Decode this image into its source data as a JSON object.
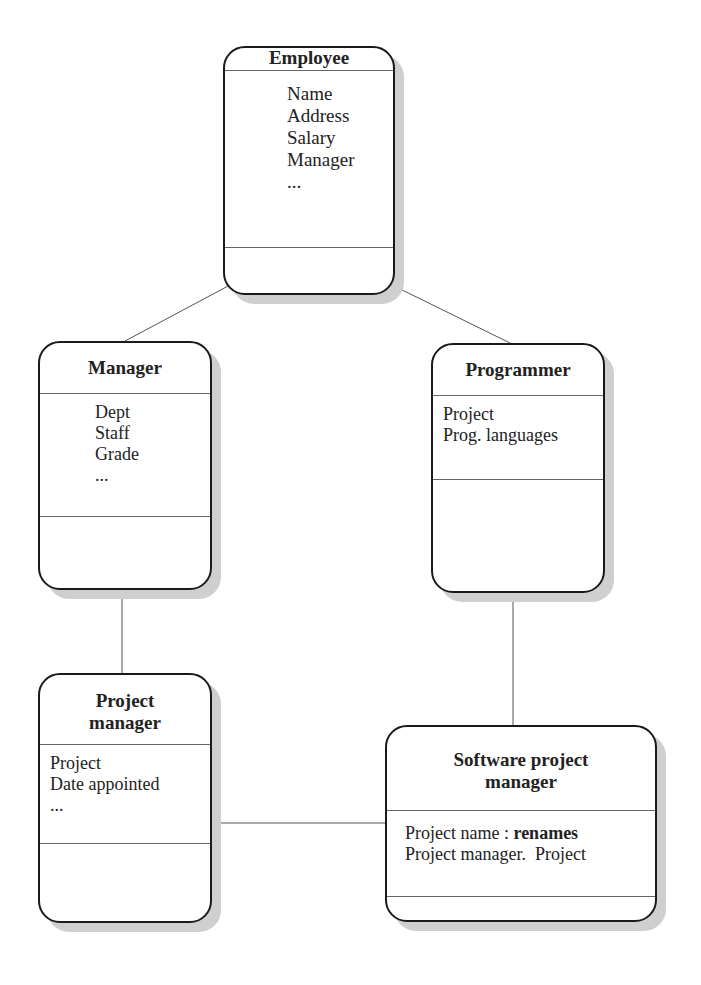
{
  "diagram": {
    "type": "class-hierarchy",
    "classes": {
      "employee": {
        "name": "Employee",
        "attributes": [
          "Name",
          "Address",
          "Salary",
          "Manager",
          "..."
        ]
      },
      "manager": {
        "name": "Manager",
        "attributes": [
          "Dept",
          "Staff",
          "Grade",
          "..."
        ]
      },
      "programmer": {
        "name": "Programmer",
        "attributes": [
          "Project",
          "Prog. languages"
        ]
      },
      "project_manager": {
        "name_line1": "Project",
        "name_line2": "manager",
        "attributes": [
          "Project",
          "Date appointed",
          "..."
        ]
      },
      "software_project_manager": {
        "name_line1": "Software project",
        "name_line2": "manager",
        "attributes": [
          {
            "text": "Project name : ",
            "bold": "renames"
          },
          {
            "text": "Project manager.  Project"
          }
        ]
      }
    },
    "links": [
      {
        "from": "Employee",
        "to": "Manager"
      },
      {
        "from": "Employee",
        "to": "Programmer"
      },
      {
        "from": "Manager",
        "to": "Project manager"
      },
      {
        "from": "Programmer",
        "to": "Software project manager"
      },
      {
        "from": "Project manager",
        "to": "Software project manager"
      }
    ]
  }
}
